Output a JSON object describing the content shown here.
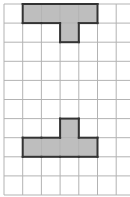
{
  "grid": {
    "origin_x": 4,
    "origin_y": 4,
    "cell_w": 18.7,
    "cell_h": 19.1,
    "cols": 7,
    "rows": 10,
    "line_color": "#b3b3b3"
  },
  "shapes": [
    {
      "name": "top-t-shape",
      "cells": [
        [
          0,
          1
        ],
        [
          0,
          2
        ],
        [
          0,
          3
        ],
        [
          0,
          4
        ],
        [
          1,
          3
        ]
      ],
      "fill": "#bebebe",
      "stroke": "#333333"
    },
    {
      "name": "bottom-t-shape",
      "cells": [
        [
          6,
          3
        ],
        [
          7,
          1
        ],
        [
          7,
          2
        ],
        [
          7,
          3
        ],
        [
          7,
          4
        ]
      ],
      "fill": "#bebebe",
      "stroke": "#333333"
    }
  ]
}
